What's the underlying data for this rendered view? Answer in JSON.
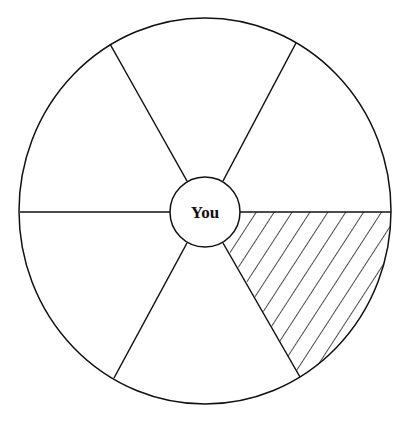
{
  "diagram": {
    "title": "",
    "center_label": "You",
    "segments": 6,
    "highlighted_segment": "lower-right",
    "highlight_pattern": "diagonal-hatch",
    "colors": {
      "stroke": "#111111",
      "background": "#ffffff"
    }
  }
}
